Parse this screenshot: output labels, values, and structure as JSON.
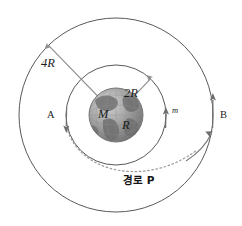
{
  "figure": {
    "colors": {
      "orbit_line": "#595959",
      "radius_line": "#8e8e8e",
      "dotted_path": "#9a9a9a",
      "arrow": "#6e6e6e",
      "label_text": "#1b1b1b",
      "globe_ocean": "#9c9c9c",
      "globe_land": "#6f6f6f",
      "background": "#ffffff"
    }
  },
  "labels": {
    "outer_radius": "4R",
    "inner_radius": "2R",
    "central_mass": "M",
    "planet_radius": "R",
    "satellite_mass": "m",
    "point_a": "A",
    "point_b": "B",
    "path_label": "경로 P"
  },
  "geometry": {
    "center": {
      "x": 116,
      "y": 115
    },
    "planet_radius_px": 27,
    "inner_orbit_radius_px": 50,
    "outer_orbit_radius_px": 97
  },
  "icons": {
    "globe": "earth-globe-icon",
    "arrow_a": "down-arrow-icon",
    "arrow_m": "up-arrow-icon",
    "arrow_b_outer": "up-arrow-icon",
    "arrow_b_path": "up-arrow-icon",
    "arrow_4r": "radius-arrow-icon",
    "arrow_2r": "radius-arrow-icon"
  }
}
